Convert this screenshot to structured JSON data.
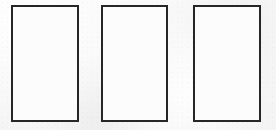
{
  "canvas": {
    "width": 276,
    "height": 130,
    "background_color": "#f8f8f8",
    "texture": "scanned-paper-grain"
  },
  "figure": {
    "title": "",
    "shape_count": 3,
    "border_color": "#262626",
    "border_width_px": 2,
    "fill_color": "#fcfcfc"
  },
  "shapes": [
    {
      "name": "rectangle-1",
      "label": "",
      "content": "",
      "x": 11,
      "y": 5,
      "width": 68,
      "height": 117,
      "border_color": "#262626",
      "fill_color": "#fcfcfc"
    },
    {
      "name": "rectangle-2",
      "label": "",
      "content": "",
      "x": 101,
      "y": 5,
      "width": 67,
      "height": 117,
      "border_color": "#262626",
      "fill_color": "#fcfcfc"
    },
    {
      "name": "rectangle-3",
      "label": "",
      "content": "",
      "x": 193,
      "y": 5,
      "width": 68,
      "height": 117,
      "border_color": "#262626",
      "fill_color": "#fcfcfc"
    }
  ]
}
